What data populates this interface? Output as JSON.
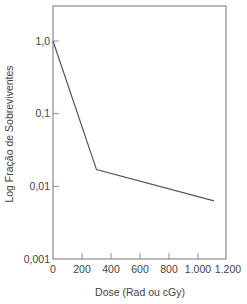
{
  "chart_data": {
    "type": "line",
    "title": "",
    "xlabel": "Dose (Rad ou cGy)",
    "ylabel": "Log Fração de Sobreviventes",
    "x_scale": "linear",
    "y_scale": "log",
    "xlim": [
      0,
      1200
    ],
    "ylim": [
      0.001,
      1.0
    ],
    "x_ticks": [
      0,
      200,
      400,
      600,
      800,
      1000,
      1200
    ],
    "x_tick_labels": [
      "0",
      "200",
      "400",
      "600",
      "800",
      "1.000",
      "1.200"
    ],
    "y_ticks": [
      1.0,
      0.1,
      0.01,
      0.001
    ],
    "y_tick_labels": [
      "1,0",
      "0,1",
      "0,01",
      "0,001"
    ],
    "grid": false,
    "legend": null,
    "series": [
      {
        "name": "Curva de sobrevivência",
        "x": [
          0,
          300,
          1110
        ],
        "y": [
          1.0,
          0.017,
          0.0063
        ],
        "color": "#555555"
      }
    ]
  },
  "labels": {
    "xlabel": "Dose (Rad ou cGy)",
    "ylabel": "Log Fração de Sobreviventes",
    "x_ticks": [
      "0",
      "200",
      "400",
      "600",
      "800",
      "1.000",
      "1.200"
    ],
    "y_ticks": [
      "1,0",
      "0,1",
      "0,01",
      "0,001"
    ]
  }
}
